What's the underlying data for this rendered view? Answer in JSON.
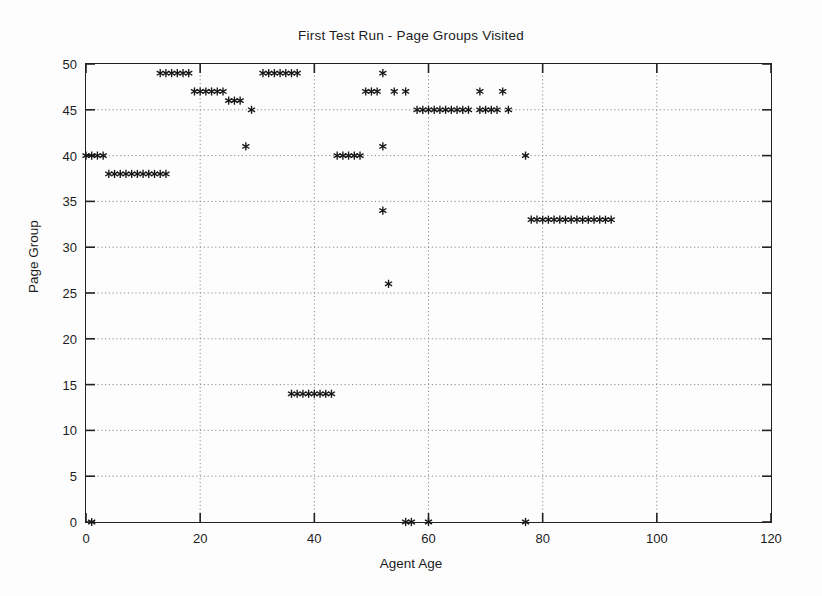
{
  "chart_data": {
    "type": "scatter",
    "title": "First Test Run - Page Groups Visited",
    "xlabel": "Agent Age",
    "ylabel": "Page Group",
    "xlim": [
      0,
      120
    ],
    "ylim": [
      0,
      50
    ],
    "xticks": [
      0,
      20,
      40,
      60,
      80,
      100,
      120
    ],
    "yticks": [
      0,
      5,
      10,
      15,
      20,
      25,
      30,
      35,
      40,
      45,
      50
    ],
    "grid": true,
    "legend": "none",
    "marker": "asterisk",
    "marker_color": "#151515",
    "points": [
      {
        "x": 0,
        "y": 40
      },
      {
        "x": 1,
        "y": 40
      },
      {
        "x": 2,
        "y": 40
      },
      {
        "x": 3,
        "y": 40
      },
      {
        "x": 1,
        "y": 0
      },
      {
        "x": 4,
        "y": 38
      },
      {
        "x": 5,
        "y": 38
      },
      {
        "x": 6,
        "y": 38
      },
      {
        "x": 7,
        "y": 38
      },
      {
        "x": 8,
        "y": 38
      },
      {
        "x": 9,
        "y": 38
      },
      {
        "x": 10,
        "y": 38
      },
      {
        "x": 11,
        "y": 38
      },
      {
        "x": 12,
        "y": 38
      },
      {
        "x": 13,
        "y": 38
      },
      {
        "x": 14,
        "y": 38
      },
      {
        "x": 13,
        "y": 49
      },
      {
        "x": 14,
        "y": 49
      },
      {
        "x": 15,
        "y": 49
      },
      {
        "x": 16,
        "y": 49
      },
      {
        "x": 17,
        "y": 49
      },
      {
        "x": 18,
        "y": 49
      },
      {
        "x": 19,
        "y": 47
      },
      {
        "x": 20,
        "y": 47
      },
      {
        "x": 21,
        "y": 47
      },
      {
        "x": 22,
        "y": 47
      },
      {
        "x": 23,
        "y": 47
      },
      {
        "x": 24,
        "y": 47
      },
      {
        "x": 25,
        "y": 46
      },
      {
        "x": 26,
        "y": 46
      },
      {
        "x": 27,
        "y": 46
      },
      {
        "x": 29,
        "y": 45
      },
      {
        "x": 28,
        "y": 41
      },
      {
        "x": 31,
        "y": 49
      },
      {
        "x": 32,
        "y": 49
      },
      {
        "x": 33,
        "y": 49
      },
      {
        "x": 34,
        "y": 49
      },
      {
        "x": 35,
        "y": 49
      },
      {
        "x": 36,
        "y": 49
      },
      {
        "x": 37,
        "y": 49
      },
      {
        "x": 36,
        "y": 14
      },
      {
        "x": 37,
        "y": 14
      },
      {
        "x": 38,
        "y": 14
      },
      {
        "x": 39,
        "y": 14
      },
      {
        "x": 40,
        "y": 14
      },
      {
        "x": 41,
        "y": 14
      },
      {
        "x": 42,
        "y": 14
      },
      {
        "x": 43,
        "y": 14
      },
      {
        "x": 44,
        "y": 40
      },
      {
        "x": 45,
        "y": 40
      },
      {
        "x": 46,
        "y": 40
      },
      {
        "x": 47,
        "y": 40
      },
      {
        "x": 48,
        "y": 40
      },
      {
        "x": 49,
        "y": 47
      },
      {
        "x": 50,
        "y": 47
      },
      {
        "x": 51,
        "y": 47
      },
      {
        "x": 52,
        "y": 49
      },
      {
        "x": 52,
        "y": 41
      },
      {
        "x": 52,
        "y": 34
      },
      {
        "x": 53,
        "y": 26
      },
      {
        "x": 54,
        "y": 47
      },
      {
        "x": 56,
        "y": 47
      },
      {
        "x": 56,
        "y": 0
      },
      {
        "x": 57,
        "y": 0
      },
      {
        "x": 60,
        "y": 0
      },
      {
        "x": 58,
        "y": 45
      },
      {
        "x": 59,
        "y": 45
      },
      {
        "x": 60,
        "y": 45
      },
      {
        "x": 61,
        "y": 45
      },
      {
        "x": 62,
        "y": 45
      },
      {
        "x": 63,
        "y": 45
      },
      {
        "x": 64,
        "y": 45
      },
      {
        "x": 65,
        "y": 45
      },
      {
        "x": 66,
        "y": 45
      },
      {
        "x": 67,
        "y": 45
      },
      {
        "x": 69,
        "y": 45
      },
      {
        "x": 70,
        "y": 45
      },
      {
        "x": 71,
        "y": 45
      },
      {
        "x": 72,
        "y": 45
      },
      {
        "x": 74,
        "y": 45
      },
      {
        "x": 69,
        "y": 47
      },
      {
        "x": 73,
        "y": 47
      },
      {
        "x": 77,
        "y": 40
      },
      {
        "x": 77,
        "y": 0
      },
      {
        "x": 78,
        "y": 33
      },
      {
        "x": 79,
        "y": 33
      },
      {
        "x": 80,
        "y": 33
      },
      {
        "x": 81,
        "y": 33
      },
      {
        "x": 82,
        "y": 33
      },
      {
        "x": 83,
        "y": 33
      },
      {
        "x": 84,
        "y": 33
      },
      {
        "x": 85,
        "y": 33
      },
      {
        "x": 86,
        "y": 33
      },
      {
        "x": 87,
        "y": 33
      },
      {
        "x": 88,
        "y": 33
      },
      {
        "x": 89,
        "y": 33
      },
      {
        "x": 90,
        "y": 33
      },
      {
        "x": 91,
        "y": 33
      },
      {
        "x": 92,
        "y": 33
      }
    ]
  }
}
